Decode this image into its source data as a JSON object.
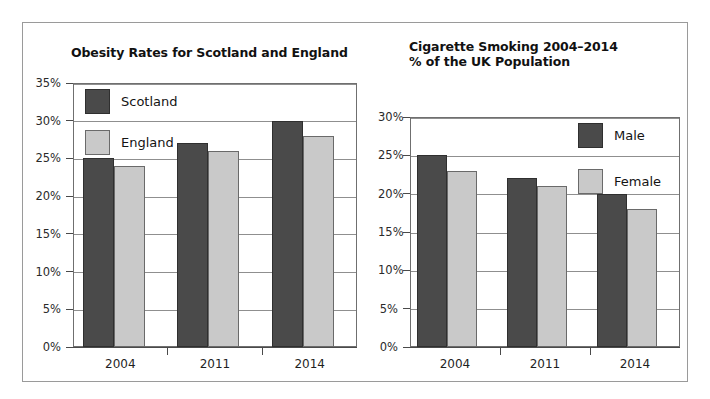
{
  "figure": {
    "background": "#ffffff",
    "border_color": "#9a9a9a",
    "dark_series_color": "#4a4a4a",
    "light_series_color": "#c9c9c9"
  },
  "chart_data": [
    {
      "type": "bar",
      "title": "Obesity Rates for Scotland and England",
      "xlabel": "",
      "ylabel": "",
      "categories": [
        "2004",
        "2011",
        "2014"
      ],
      "series": [
        {
          "name": "Scotland",
          "values": [
            25,
            27,
            30
          ],
          "color": "#4a4a4a"
        },
        {
          "name": "England",
          "values": [
            24,
            26,
            28
          ],
          "color": "#c9c9c9"
        }
      ],
      "ylim": [
        0,
        35
      ],
      "ytick_labels": [
        "0%",
        "5%",
        "10%",
        "15%",
        "20%",
        "25%",
        "30%",
        "35%"
      ],
      "ytick_values": [
        0,
        5,
        10,
        15,
        20,
        25,
        30,
        35
      ],
      "grid": true,
      "legend_position": "upper-left"
    },
    {
      "type": "bar",
      "title": "Cigarette Smoking 2004–2014",
      "subtitle": "% of the UK Population",
      "xlabel": "",
      "ylabel": "",
      "categories": [
        "2004",
        "2011",
        "2014"
      ],
      "series": [
        {
          "name": "Male",
          "values": [
            25,
            22,
            20
          ],
          "color": "#4a4a4a"
        },
        {
          "name": "Female",
          "values": [
            23,
            21,
            18
          ],
          "color": "#c9c9c9"
        }
      ],
      "ylim": [
        0,
        30
      ],
      "ytick_labels": [
        "0%",
        "5%",
        "10%",
        "15%",
        "20%",
        "25%",
        "30%"
      ],
      "ytick_values": [
        0,
        5,
        10,
        15,
        20,
        25,
        30
      ],
      "grid": true,
      "legend_position": "upper-right"
    }
  ]
}
